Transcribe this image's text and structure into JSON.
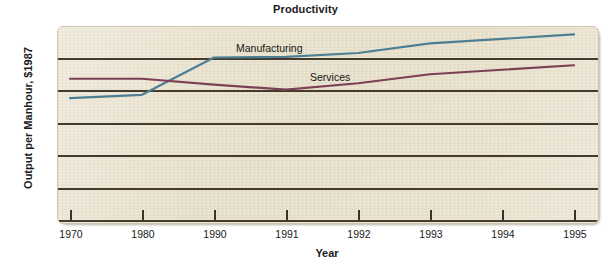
{
  "chart_data": {
    "type": "line",
    "title": "Productivity",
    "xlabel": "Year",
    "ylabel": "Output per Manhour, $1987",
    "categories": [
      "1970",
      "1980",
      "1990",
      "1991",
      "1992",
      "1993",
      "1994",
      "1995"
    ],
    "x": [
      1970,
      1980,
      1990,
      1991,
      1992,
      1993,
      1994,
      1995
    ],
    "ylim": [
      0,
      30
    ],
    "yticks": [
      0,
      5,
      10,
      15,
      20,
      25,
      30
    ],
    "ytick_labels": [
      "0",
      "5",
      "10",
      "15",
      "20",
      "25",
      "30"
    ],
    "grid": "horizontal",
    "legend": "inline-labels",
    "series": [
      {
        "name": "Manufacturing",
        "color": "#4d7f94",
        "values": [
          18.8,
          19.3,
          25.1,
          25.2,
          25.8,
          27.3,
          28.0,
          28.7
        ]
      },
      {
        "name": "Services",
        "color": "#7b4055",
        "values": [
          21.8,
          21.8,
          20.9,
          20.1,
          21.1,
          22.5,
          23.2,
          23.9
        ]
      }
    ],
    "annotations": [
      {
        "text": "Manufacturing",
        "series": "Manufacturing"
      },
      {
        "text": "Services",
        "series": "Services"
      }
    ]
  },
  "style": {
    "plot_background": "#e9e2ce",
    "gridline_color": "#453a2c",
    "page_background": "#ffffff",
    "text_color": "#1a1a1a"
  }
}
